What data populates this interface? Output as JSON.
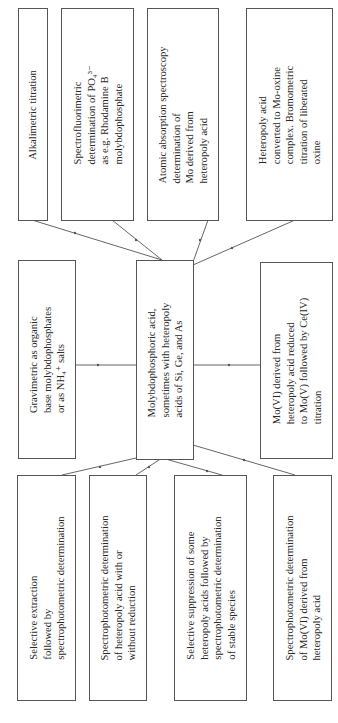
{
  "diagram": {
    "orientation": "rotated-90-ccw",
    "center": {
      "lines": [
        "Molybdophosphoric acid,",
        "sometimes with heteropoly",
        "acids of Si, Ge, and As"
      ]
    },
    "outputs_top": [
      {
        "lines": [
          "Alkalimetric titration"
        ]
      },
      {
        "lines": [
          "Spectrofluorimetric",
          "determination of PO₄³⁻",
          "as e.g. Rhodamine B",
          "molybdophosphate"
        ]
      },
      {
        "lines": [
          "Atomic absorption spectroscopy",
          "determination of",
          "Mo derived from",
          "heteropoly acid"
        ]
      },
      {
        "lines": [
          "Heteropoly acid",
          "converted to Mo-oxine",
          "complex. Bromometric",
          "titration of liberated",
          "oxine"
        ]
      }
    ],
    "outputs_middle": [
      {
        "lines": [
          "Gravimetric as organic",
          "base molybdophosphates",
          "or as NH₄⁺  salts"
        ]
      },
      {
        "lines": [
          "Mo(VI) derived from",
          "heteropoly acid reduced",
          "to Mo(V) followed by Ce(IV)",
          "titration"
        ]
      }
    ],
    "outputs_bottom": [
      {
        "lines": [
          "Selective extraction",
          "followed by",
          "spectrophotometric determination"
        ]
      },
      {
        "lines": [
          "Spectrophotometric determination",
          "of heteropoly acid with or",
          "without reduction"
        ]
      },
      {
        "lines": [
          "Selective suppression of some",
          "heteropoly acids followed by",
          "spectrophotometric determination",
          "of stable species"
        ]
      },
      {
        "lines": [
          "Spectrophotometric determination",
          "of Mo(VI) derived from",
          "heteropoly acid"
        ]
      }
    ],
    "colors": {
      "line": "#555555",
      "text": "#2a2a2a",
      "background": "#ffffff"
    }
  }
}
